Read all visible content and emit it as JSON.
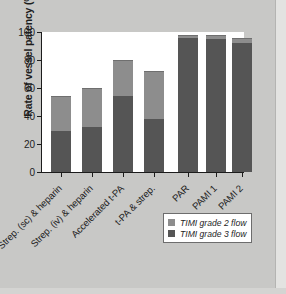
{
  "chart_data": {
    "type": "bar",
    "subtype": "stacked-bar",
    "title": "",
    "xlabel": "",
    "ylabel": "Rate of vessel patency (%)",
    "ylim": [
      0,
      100
    ],
    "yticks": [
      0,
      20,
      40,
      60,
      80,
      100
    ],
    "ytick_labels": [
      "0",
      "20",
      "40",
      "60",
      "80",
      "100"
    ],
    "grid": false,
    "legend_position": "lower-right",
    "categories": [
      "Strep. (sc) & heparin",
      "Strep. (iv) & heparin",
      "Accelerated t-PA",
      "t-PA & strep.",
      "PAR",
      "PAMI 1",
      "PAMI 2"
    ],
    "series": [
      {
        "name": "TIMI grade 3 flow",
        "color": "#555555",
        "values": [
          29,
          32,
          54,
          38,
          96,
          95,
          92
        ]
      },
      {
        "name": "TIMI grade 2 flow",
        "color": "#8d8d8d",
        "values": [
          25,
          28,
          26,
          34,
          2,
          3,
          4
        ]
      }
    ],
    "totals": [
      54,
      60,
      80,
      72,
      98,
      98,
      96
    ]
  },
  "legend": {
    "entries": [
      {
        "label": "TIMI grade 2 flow",
        "color": "#8d8d8d"
      },
      {
        "label": "TIMI grade 3 flow",
        "color": "#555555"
      }
    ]
  }
}
